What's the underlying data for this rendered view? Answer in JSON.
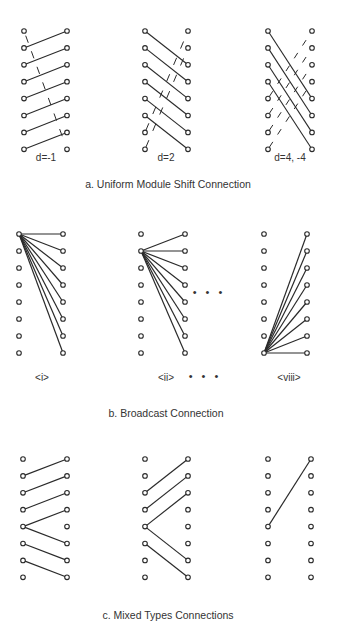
{
  "figure": {
    "sections": [
      {
        "id": "a",
        "caption": "a. Uniform Module Shift Connection",
        "panels": [
          {
            "label": "d=-1",
            "type": "shift",
            "shift": -1
          },
          {
            "label": "d=2",
            "type": "shift",
            "shift": 2
          },
          {
            "label": "d=4, -4",
            "type": "shift",
            "shift": [
              4,
              -4
            ]
          }
        ]
      },
      {
        "id": "b",
        "caption": "b.  Broadcast Connection",
        "panels": [
          {
            "label": "<i>",
            "type": "broadcast",
            "source": 0
          },
          {
            "label": "<ii>",
            "type": "broadcast",
            "source": 1
          },
          {
            "label": "<viii>",
            "type": "broadcast",
            "source": 7
          }
        ],
        "ellipsis": "• • •"
      },
      {
        "id": "c",
        "caption": "c.  Mixed Types Connections",
        "panels": [
          {
            "type": "mixed",
            "edges": [
              [
                1,
                0
              ],
              [
                2,
                1
              ],
              [
                3,
                2
              ],
              [
                4,
                3
              ],
              [
                4,
                5
              ],
              [
                5,
                6
              ],
              [
                6,
                7
              ]
            ]
          },
          {
            "type": "mixed",
            "edges": [
              [
                2,
                0
              ],
              [
                3,
                1
              ],
              [
                4,
                2
              ],
              [
                4,
                6
              ],
              [
                5,
                7
              ]
            ]
          },
          {
            "type": "mixed",
            "edges": [
              [
                4,
                0
              ]
            ]
          }
        ]
      }
    ],
    "nodes_per_column": 8,
    "colors": {
      "line": "#2a2a2a",
      "node_fill": "#ffffff",
      "background": "#ffffff"
    }
  }
}
